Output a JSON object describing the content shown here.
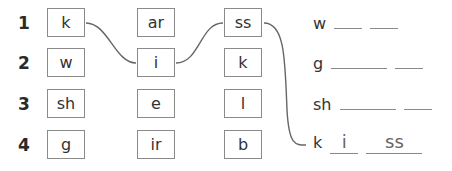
{
  "rows": [
    {
      "number": "1",
      "col1": "k",
      "col2": "ar",
      "col3": "ss"
    },
    {
      "number": "2",
      "col1": "w",
      "col2": "i",
      "col3": "k"
    },
    {
      "number": "3",
      "col1": "sh",
      "col2": "e",
      "col3": "l"
    },
    {
      "number": "4",
      "col1": "g",
      "col2": "ir",
      "col3": "b"
    }
  ],
  "answers": [
    {
      "start": "w",
      "blank1": "",
      "blank2": ""
    },
    {
      "start": "g",
      "blank1": "",
      "blank2": ""
    },
    {
      "start": "sh",
      "blank1": "",
      "blank2": ""
    },
    {
      "start": "k",
      "blank1": "i",
      "blank2": "ss"
    }
  ],
  "colors": {
    "line": "#666666",
    "border": "#8a8a8a",
    "text": "#333333"
  }
}
